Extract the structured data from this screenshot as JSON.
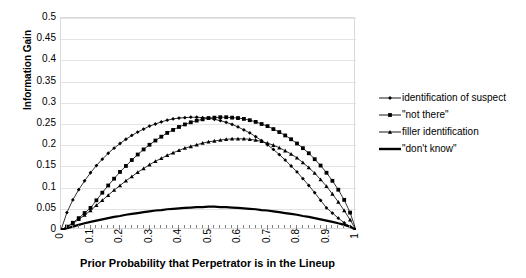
{
  "chart_data": {
    "type": "line",
    "title": "",
    "xlabel": "Prior Probability that Perpetrator is in the Lineup",
    "ylabel": "Information Gain",
    "xlim": [
      0,
      1
    ],
    "ylim": [
      0,
      0.5
    ],
    "grid": true,
    "legend_position": "right",
    "xticks": [
      "0",
      "0.1",
      "0.2",
      "0.3",
      "0.4",
      "0.5",
      "0.6",
      "0.7",
      "0.8",
      "0.9",
      "1"
    ],
    "xtick_values": [
      0,
      0.1,
      0.2,
      0.3,
      0.4,
      0.5,
      0.6,
      0.7,
      0.8,
      0.9,
      1
    ],
    "yticks": [
      "0",
      "0.05",
      "0.1",
      "0.15",
      "0.2",
      "0.25",
      "0.3",
      "0.35",
      "0.4",
      "0.45",
      "0.5"
    ],
    "ytick_values": [
      0,
      0.05,
      0.1,
      0.15,
      0.2,
      0.25,
      0.3,
      0.35,
      0.4,
      0.45,
      0.5
    ],
    "x": [
      0,
      0.02,
      0.04,
      0.06,
      0.08,
      0.1,
      0.12,
      0.14,
      0.16,
      0.18,
      0.2,
      0.22,
      0.24,
      0.26,
      0.28,
      0.3,
      0.32,
      0.34,
      0.36,
      0.38,
      0.4,
      0.42,
      0.44,
      0.46,
      0.48,
      0.5,
      0.52,
      0.54,
      0.56,
      0.58,
      0.6,
      0.62,
      0.64,
      0.66,
      0.68,
      0.7,
      0.72,
      0.74,
      0.76,
      0.78,
      0.8,
      0.82,
      0.84,
      0.86,
      0.88,
      0.9,
      0.92,
      0.94,
      0.96,
      0.98,
      1
    ],
    "series": [
      {
        "name": "identification of suspect",
        "marker": "diamond",
        "color": "#000000",
        "values": [
          0,
          0.041,
          0.071,
          0.095,
          0.116,
          0.135,
          0.152,
          0.167,
          0.181,
          0.193,
          0.204,
          0.214,
          0.223,
          0.231,
          0.238,
          0.245,
          0.25,
          0.255,
          0.259,
          0.262,
          0.264,
          0.265,
          0.266,
          0.266,
          0.265,
          0.264,
          0.261,
          0.258,
          0.254,
          0.249,
          0.243,
          0.236,
          0.229,
          0.22,
          0.211,
          0.201,
          0.19,
          0.178,
          0.165,
          0.151,
          0.137,
          0.121,
          0.105,
          0.088,
          0.07,
          0.052,
          0.04,
          0.028,
          0.017,
          0.008,
          0
        ]
      },
      {
        "name": "\"not there\"",
        "marker": "square",
        "color": "#000000",
        "values": [
          0,
          0.008,
          0.017,
          0.028,
          0.04,
          0.052,
          0.07,
          0.088,
          0.105,
          0.121,
          0.137,
          0.151,
          0.165,
          0.178,
          0.19,
          0.201,
          0.211,
          0.22,
          0.229,
          0.236,
          0.243,
          0.249,
          0.254,
          0.258,
          0.261,
          0.264,
          0.265,
          0.266,
          0.266,
          0.265,
          0.264,
          0.262,
          0.259,
          0.255,
          0.25,
          0.245,
          0.238,
          0.231,
          0.223,
          0.214,
          0.204,
          0.193,
          0.181,
          0.167,
          0.152,
          0.135,
          0.116,
          0.095,
          0.071,
          0.041,
          0
        ]
      },
      {
        "name": "filler identification",
        "marker": "triangle",
        "color": "#000000",
        "values": [
          0,
          0.007,
          0.015,
          0.025,
          0.035,
          0.046,
          0.058,
          0.07,
          0.082,
          0.094,
          0.105,
          0.116,
          0.126,
          0.136,
          0.145,
          0.154,
          0.162,
          0.169,
          0.176,
          0.182,
          0.188,
          0.193,
          0.197,
          0.201,
          0.205,
          0.208,
          0.21,
          0.212,
          0.214,
          0.215,
          0.215,
          0.215,
          0.214,
          0.212,
          0.209,
          0.205,
          0.2,
          0.194,
          0.187,
          0.179,
          0.17,
          0.159,
          0.147,
          0.134,
          0.119,
          0.103,
          0.085,
          0.066,
          0.046,
          0.024,
          0
        ]
      },
      {
        "name": "\"don't know\"",
        "marker": "none",
        "color": "#000000",
        "values": [
          0,
          0.004,
          0.008,
          0.012,
          0.016,
          0.019,
          0.022,
          0.025,
          0.028,
          0.031,
          0.033,
          0.036,
          0.038,
          0.04,
          0.042,
          0.044,
          0.046,
          0.047,
          0.049,
          0.05,
          0.051,
          0.052,
          0.053,
          0.054,
          0.054,
          0.055,
          0.055,
          0.054,
          0.054,
          0.053,
          0.052,
          0.051,
          0.05,
          0.049,
          0.047,
          0.046,
          0.044,
          0.042,
          0.04,
          0.038,
          0.036,
          0.033,
          0.031,
          0.028,
          0.025,
          0.022,
          0.019,
          0.016,
          0.012,
          0.008,
          0
        ]
      }
    ]
  },
  "legend": {
    "items": [
      {
        "label": "identification of suspect",
        "marker": "diamond"
      },
      {
        "label": "\"not there\"",
        "marker": "square"
      },
      {
        "label": "filler identification",
        "marker": "triangle"
      },
      {
        "label": "\"don't know\"",
        "marker": "none"
      }
    ]
  }
}
